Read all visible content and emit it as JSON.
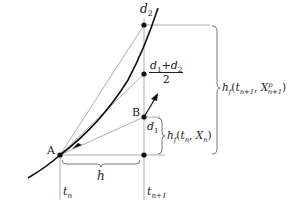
{
  "diagram": {
    "type": "numerical-method-predictor-corrector",
    "points": {
      "A": {
        "label": "A"
      },
      "B": {
        "label": "B"
      },
      "d1": {
        "label": "d",
        "sub": "1"
      },
      "d2": {
        "label": "d",
        "sub": "2"
      },
      "mid": {
        "num_a": "d",
        "num_a_sub": "1",
        "plus": "+",
        "num_b": "d",
        "num_b_sub": "2",
        "den": "2"
      }
    },
    "axis_labels": {
      "tn": {
        "label": "t",
        "sub": "n"
      },
      "tn1": {
        "label": "t",
        "sub": "n+1"
      }
    },
    "braces": {
      "h": {
        "label": "h"
      },
      "small": {
        "prefix": "h",
        "prefix_sub": "f",
        "open": "(",
        "t": "t",
        "t_sub": "n",
        "comma": ", ",
        "x": "X",
        "x_sub": "n",
        "close": ")"
      },
      "big": {
        "prefix": "h",
        "prefix_sub": "f",
        "open": "(",
        "t": "t",
        "t_sub": "n+1",
        "comma": ", ",
        "x": "X",
        "x_sub": "n+1",
        "x_sup": "p",
        "close": ")"
      }
    },
    "colors": {
      "curve": "#111111",
      "thin_lines": "#9a9a9a",
      "dots": "#111111",
      "text": "#222222"
    }
  }
}
